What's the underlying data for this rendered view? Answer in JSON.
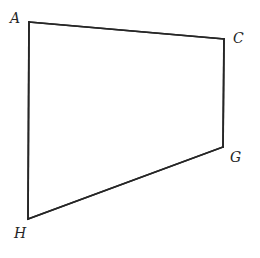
{
  "figure": {
    "name": "quadrilateral-achg",
    "background_color": "#ffffff",
    "stroke_color": "#262626",
    "stroke_width": 1.6,
    "canvas": {
      "width": 260,
      "height": 258
    },
    "vertices": [
      {
        "id": "A",
        "label": "A",
        "x": 29,
        "y": 22,
        "label_x": 10,
        "label_y": 11
      },
      {
        "id": "C",
        "label": "C",
        "x": 224,
        "y": 39,
        "label_x": 233,
        "label_y": 31
      },
      {
        "id": "G",
        "label": "G",
        "x": 223,
        "y": 147,
        "label_x": 230,
        "label_y": 150
      },
      {
        "id": "H",
        "label": "H",
        "x": 28,
        "y": 219,
        "label_x": 14,
        "label_y": 226
      }
    ],
    "edges": [
      {
        "id": "AC",
        "from": "A",
        "to": "C"
      },
      {
        "id": "CG",
        "from": "C",
        "to": "G"
      },
      {
        "id": "GH",
        "from": "G",
        "to": "H"
      },
      {
        "id": "HA",
        "from": "H",
        "to": "A"
      }
    ],
    "path": "M 29 22 L 224 39 L 223 147 L 28 219 Z"
  }
}
